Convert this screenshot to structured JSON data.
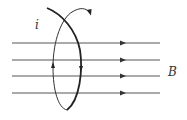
{
  "diagram": {
    "labels": {
      "current": "i",
      "field": "B"
    },
    "field_lines": {
      "count": 4,
      "y_positions": [
        43,
        60,
        76,
        93
      ],
      "x_start": 12,
      "x_end": 160,
      "arrow_x": 123,
      "direction": "right",
      "color": "#444444"
    },
    "loop": {
      "color": "#222222",
      "current_direction_arrows": [
        "up-on-left-arc",
        "down-on-right-arc"
      ]
    }
  }
}
